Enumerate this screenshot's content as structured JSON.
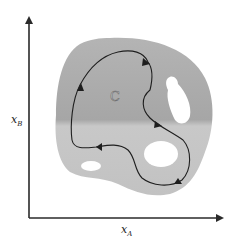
{
  "figure": {
    "type": "state-space region with closed cycle",
    "region_label": "C",
    "x_axis": {
      "symbol": "x",
      "subscript": "A"
    },
    "y_axis": {
      "symbol": "x",
      "subscript": "B"
    },
    "colors": {
      "background": "#ffffff",
      "axis": "#2a2a2a",
      "region_dark": "#a9a9a9",
      "region_light": "#c4c4c4",
      "holes": "#ffffff",
      "cycle_path": "#1e1e1e"
    },
    "holes": [
      {
        "name": "upper-right-hole",
        "shape": "teardrop"
      },
      {
        "name": "lower-right-hole",
        "shape": "circle"
      },
      {
        "name": "lower-left-hole",
        "shape": "ellipse"
      }
    ],
    "cycle": {
      "direction": "clockwise",
      "arrow_count": 5
    }
  }
}
